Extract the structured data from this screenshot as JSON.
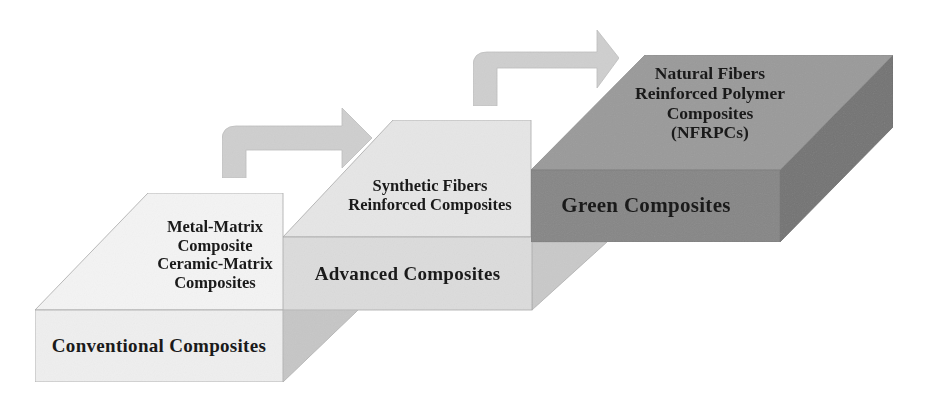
{
  "diagram": {
    "type": "stepped-3d-blocks-progression",
    "colors": {
      "conventional_top": "#f4f4f4",
      "conventional_front": "#efefef",
      "conventional_side": "#c9c9c9",
      "advanced_top": "#e6e6e6",
      "advanced_front": "#dcdcdc",
      "advanced_side": "#c2c2c2",
      "green_top": "#9a9a9a",
      "green_front": "#868686",
      "green_side": "#737373",
      "arrow": "#cfcfcf",
      "edge": "#9e9e9e"
    },
    "blocks": [
      {
        "id": "conventional",
        "front_label": "Conventional Composites",
        "top_lines": [
          "Metal-Matrix",
          "Composite",
          "Ceramic-Matrix",
          "Composites"
        ]
      },
      {
        "id": "advanced",
        "front_label": "Advanced Composites",
        "top_lines": [
          "Synthetic Fibers",
          "Reinforced Composites"
        ]
      },
      {
        "id": "green",
        "front_label": "Green Composites",
        "top_lines": [
          "Natural Fibers",
          "Reinforced Polymer",
          "Composites",
          "(NFRPCs)"
        ]
      }
    ],
    "arrows": [
      {
        "from": "conventional",
        "to": "advanced",
        "icon": "curved-right-arrow-icon"
      },
      {
        "from": "advanced",
        "to": "green",
        "icon": "curved-right-arrow-icon"
      }
    ]
  }
}
